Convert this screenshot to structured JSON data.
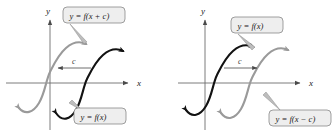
{
  "figure": {
    "background": "#ffffff",
    "colors": {
      "curve_original": "#121212",
      "curve_shifted": "#9a9a9a",
      "axis": "#6e6e6e",
      "callout_fill": "#eeeeee",
      "callout_border": "#7a7a7a",
      "shift_arrow": "#4a4a4a"
    }
  },
  "panels": [
    {
      "id": "left",
      "name": "shift-left-panel",
      "axes": {
        "x_label": "x",
        "y_label": "y"
      },
      "shift_arrow": {
        "label": "c",
        "direction": "left"
      },
      "callouts": [
        {
          "name": "callout-shifted",
          "text": "y = f(x + c)",
          "position": "top"
        },
        {
          "name": "callout-original",
          "text": "y = f(x)",
          "position": "bottom"
        }
      ],
      "curves": [
        {
          "name": "curve-shifted",
          "equation": "y = f(x + c)",
          "color": "gray"
        },
        {
          "name": "curve-original",
          "equation": "y = f(x)",
          "color": "black"
        }
      ]
    },
    {
      "id": "right",
      "name": "shift-right-panel",
      "axes": {
        "x_label": "x",
        "y_label": "y"
      },
      "shift_arrow": {
        "label": "c",
        "direction": "right"
      },
      "callouts": [
        {
          "name": "callout-original",
          "text": "y = f(x)",
          "position": "top"
        },
        {
          "name": "callout-shifted",
          "text": "y = f(x − c)",
          "position": "bottom"
        }
      ],
      "curves": [
        {
          "name": "curve-original",
          "equation": "y = f(x)",
          "color": "black"
        },
        {
          "name": "curve-shifted",
          "equation": "y = f(x − c)",
          "color": "gray"
        }
      ]
    }
  ]
}
